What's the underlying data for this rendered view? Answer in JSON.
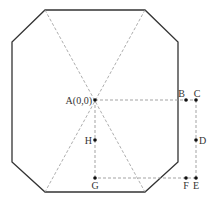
{
  "diagram": {
    "shape": "octagon",
    "colors": {
      "outline": "#333333",
      "dashed": "#999999",
      "point": "#111111",
      "label": "#333333"
    },
    "octagon_vertices": [
      [
        45,
        10
      ],
      [
        145,
        10
      ],
      [
        178,
        42
      ],
      [
        178,
        162
      ],
      [
        145,
        192
      ],
      [
        45,
        192
      ],
      [
        12,
        162
      ],
      [
        12,
        42
      ]
    ],
    "diagonals": [
      [
        [
          45,
          10
        ],
        [
          145,
          192
        ]
      ],
      [
        [
          145,
          10
        ],
        [
          45,
          192
        ]
      ]
    ],
    "points": [
      {
        "id": "A",
        "label": "A(0,0)",
        "x": 95,
        "y": 100,
        "label_pos": "left"
      },
      {
        "id": "B",
        "label": "B",
        "x": 186,
        "y": 100,
        "label_pos": "above-left"
      },
      {
        "id": "C",
        "label": "C",
        "x": 196,
        "y": 100,
        "label_pos": "above-right"
      },
      {
        "id": "D",
        "label": "D",
        "x": 196,
        "y": 140,
        "label_pos": "right"
      },
      {
        "id": "E",
        "label": "E",
        "x": 196,
        "y": 178,
        "label_pos": "below"
      },
      {
        "id": "F",
        "label": "F",
        "x": 186,
        "y": 178,
        "label_pos": "below"
      },
      {
        "id": "G",
        "label": "G",
        "x": 95,
        "y": 178,
        "label_pos": "below"
      },
      {
        "id": "H",
        "label": "H",
        "x": 95,
        "y": 140,
        "label_pos": "left"
      }
    ],
    "dashed_paths": [
      [
        [
          95,
          100
        ],
        [
          196,
          100
        ]
      ],
      [
        [
          196,
          100
        ],
        [
          196,
          178
        ]
      ],
      [
        [
          196,
          178
        ],
        [
          95,
          178
        ]
      ],
      [
        [
          95,
          178
        ],
        [
          95,
          100
        ]
      ]
    ]
  }
}
